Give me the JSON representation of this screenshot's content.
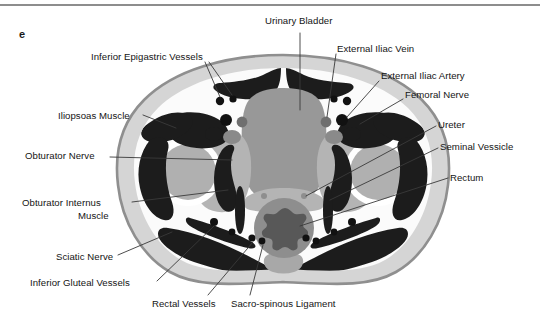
{
  "figure": {
    "panel_letter": "e",
    "caption_rule": true,
    "type": "axial-pelvic-ct-cross-section"
  },
  "labels": [
    {
      "id": "urinary-bladder",
      "text": "Urinary Bladder",
      "x": 265,
      "y": 15,
      "align": "left"
    },
    {
      "id": "inferior-epigastric",
      "text": "Inferior Epigastric Vessels",
      "x": 91,
      "y": 51,
      "align": "left"
    },
    {
      "id": "external-iliac-vein",
      "text": "External Iliac Vein",
      "x": 337,
      "y": 43,
      "align": "left"
    },
    {
      "id": "external-iliac-artery",
      "text": "External Iliac Artery",
      "x": 381,
      "y": 70,
      "align": "left"
    },
    {
      "id": "femoral-nerve",
      "text": "Femoral Nerve",
      "x": 405,
      "y": 89,
      "align": "left"
    },
    {
      "id": "iliopsoas-muscle",
      "text": "Iliopsoas Muscle",
      "x": 58,
      "y": 110,
      "align": "left"
    },
    {
      "id": "ureter",
      "text": "Ureter",
      "x": 438,
      "y": 119,
      "align": "left"
    },
    {
      "id": "obturator-nerve",
      "text": "Obturator Nerve",
      "x": 25,
      "y": 150,
      "align": "left"
    },
    {
      "id": "seminal-vessicle",
      "text": "Seminal Vessicle",
      "x": 440,
      "y": 141,
      "align": "left"
    },
    {
      "id": "obturator-internus",
      "text": "Obturator Internus",
      "x": 22,
      "y": 197,
      "align": "left"
    },
    {
      "id": "obturator-internus-2",
      "text": "Muscle",
      "x": 78,
      "y": 210,
      "align": "left"
    },
    {
      "id": "rectum",
      "text": "Rectum",
      "x": 450,
      "y": 172,
      "align": "left"
    },
    {
      "id": "sciatic-nerve",
      "text": "Sciatic Nerve",
      "x": 56,
      "y": 251,
      "align": "left"
    },
    {
      "id": "inferior-gluteal",
      "text": "Inferior Gluteal Vessels",
      "x": 30,
      "y": 277,
      "align": "left"
    },
    {
      "id": "rectal-vessels",
      "text": "Rectal Vessels",
      "x": 152,
      "y": 298,
      "align": "left"
    },
    {
      "id": "sacro-spinous",
      "text": "Sacro-spinous Ligament",
      "x": 231,
      "y": 298,
      "align": "left"
    }
  ],
  "colors": {
    "background": "#ffffff",
    "skin_rim": "#8f8f8f",
    "subcutaneous_fat": "#d5d5d5",
    "fat_plane": "#f6f6f6",
    "muscle_dark": "#1c1c1c",
    "bladder": "#989898",
    "bone_marrow": "#a9a9a9",
    "bone_cortex": "#ffffff",
    "rectum_wall": "#8e8e8e",
    "rectum_lumen": "#606060",
    "soft_tissue": "#b4b4b4",
    "leader_line": "#3a3a3a",
    "text": "#141414",
    "rule": "#8d8d8d"
  },
  "structures": {
    "midline_organs": [
      "Urinary Bladder",
      "Rectum",
      "Seminal Vessicle"
    ],
    "bilateral_muscles": [
      "Iliopsoas Muscle",
      "Obturator Internus Muscle",
      "Gluteal Muscles",
      "Rectus Abdominis"
    ],
    "bilateral_vessels": [
      "Inferior Epigastric Vessels",
      "External Iliac Vein",
      "External Iliac Artery",
      "Inferior Gluteal Vessels",
      "Rectal Vessels"
    ],
    "nerves": [
      "Femoral Nerve",
      "Obturator Nerve",
      "Sciatic Nerve"
    ],
    "ligaments": [
      "Sacro-spinous Ligament"
    ],
    "urinary": [
      "Ureter"
    ]
  }
}
